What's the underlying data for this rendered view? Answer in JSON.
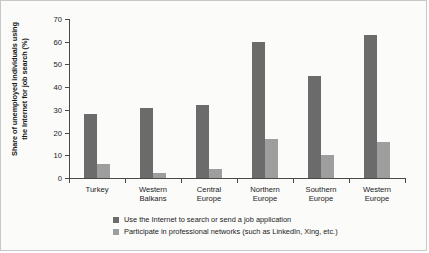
{
  "chart_data": {
    "type": "bar",
    "title": "",
    "xlabel": "",
    "ylabel": "Share of unemployed individuals using the Internet for job search (%)",
    "ylabel_line1": "Share of unemployed individuals using",
    "ylabel_line2": "the Internet for job search (%)",
    "ylim": [
      0,
      70
    ],
    "yticks": [
      0,
      10,
      20,
      30,
      40,
      50,
      60,
      70
    ],
    "grid": false,
    "legend_position": "bottom-left",
    "categories": [
      "Turkey",
      "Western Balkans",
      "Central Europe",
      "Northern Europe",
      "Southern Europe",
      "Western Europe"
    ],
    "category_lines": [
      [
        "Turkey"
      ],
      [
        "Western",
        "Balkans"
      ],
      [
        "Central",
        "Europe"
      ],
      [
        "Northern",
        "Europe"
      ],
      [
        "Southern",
        "Europe"
      ],
      [
        "Western",
        "Europe"
      ]
    ],
    "series": [
      {
        "name": "Use the Internet to search or send a job application",
        "color": "#6b6b6b",
        "values": [
          28,
          31,
          32,
          60,
          45,
          63
        ]
      },
      {
        "name": "Participate in professional networks (such as LinkedIn, Xing, etc.)",
        "color": "#9e9e9e",
        "values": [
          6,
          2,
          4,
          17,
          10,
          16
        ]
      }
    ]
  },
  "colors": {
    "series_dark": "#6b6b6b",
    "series_light": "#9e9e9e",
    "axis": "#4a4a4a",
    "text": "#1a1a1a",
    "background": "#fbfbfa",
    "border": "#c8c8c8"
  }
}
